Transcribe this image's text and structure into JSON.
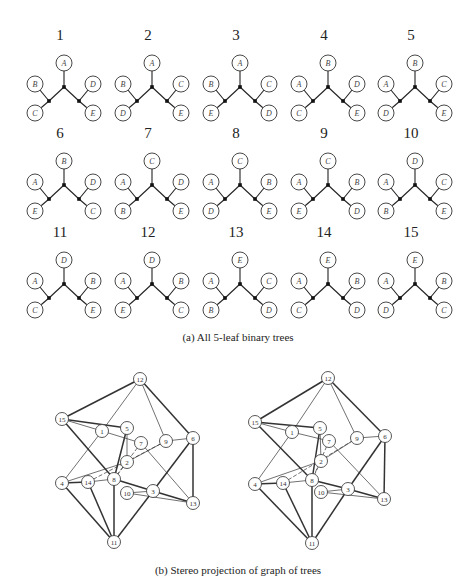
{
  "figure": {
    "part_a": {
      "caption": "(a) All 5-leaf binary trees",
      "trees": [
        {
          "id": "1",
          "top": "A",
          "left_upper": "B",
          "left_lower": "C",
          "right_upper": "D",
          "right_lower": "E"
        },
        {
          "id": "2",
          "top": "A",
          "left_upper": "B",
          "left_lower": "D",
          "right_upper": "C",
          "right_lower": "E"
        },
        {
          "id": "3",
          "top": "A",
          "left_upper": "B",
          "left_lower": "E",
          "right_upper": "C",
          "right_lower": "D"
        },
        {
          "id": "4",
          "top": "B",
          "left_upper": "A",
          "left_lower": "C",
          "right_upper": "D",
          "right_lower": "E"
        },
        {
          "id": "5",
          "top": "B",
          "left_upper": "A",
          "left_lower": "D",
          "right_upper": "C",
          "right_lower": "E"
        },
        {
          "id": "6",
          "top": "B",
          "left_upper": "A",
          "left_lower": "E",
          "right_upper": "D",
          "right_lower": "C"
        },
        {
          "id": "7",
          "top": "C",
          "left_upper": "A",
          "left_lower": "B",
          "right_upper": "D",
          "right_lower": "E"
        },
        {
          "id": "8",
          "top": "C",
          "left_upper": "A",
          "left_lower": "D",
          "right_upper": "B",
          "right_lower": "E"
        },
        {
          "id": "9",
          "top": "C",
          "left_upper": "A",
          "left_lower": "E",
          "right_upper": "B",
          "right_lower": "D"
        },
        {
          "id": "10",
          "top": "D",
          "left_upper": "A",
          "left_lower": "B",
          "right_upper": "C",
          "right_lower": "E"
        },
        {
          "id": "11",
          "top": "D",
          "left_upper": "A",
          "left_lower": "C",
          "right_upper": "B",
          "right_lower": "E"
        },
        {
          "id": "12",
          "top": "D",
          "left_upper": "A",
          "left_lower": "E",
          "right_upper": "B",
          "right_lower": "C"
        },
        {
          "id": "13",
          "top": "E",
          "left_upper": "A",
          "left_lower": "B",
          "right_upper": "C",
          "right_lower": "D"
        },
        {
          "id": "14",
          "top": "E",
          "left_upper": "A",
          "left_lower": "C",
          "right_upper": "B",
          "right_lower": "D"
        },
        {
          "id": "15",
          "top": "E",
          "left_upper": "A",
          "left_lower": "D",
          "right_upper": "B",
          "right_lower": "C"
        }
      ]
    },
    "part_b": {
      "caption": "(b) Stereo projection of graph of trees",
      "left_nodes": {
        "12": [
          140,
          379
        ],
        "15": [
          62,
          419
        ],
        "1": [
          102,
          431
        ],
        "5": [
          127,
          428
        ],
        "7": [
          141,
          443
        ],
        "9": [
          166,
          441
        ],
        "6": [
          193,
          438
        ],
        "2": [
          127,
          462
        ],
        "4": [
          62,
          483
        ],
        "14": [
          88,
          482
        ],
        "8": [
          114,
          479
        ],
        "10": [
          127,
          493
        ],
        "3": [
          153,
          491
        ],
        "13": [
          193,
          503
        ],
        "11": [
          114,
          542
        ]
      },
      "right_nodes": {
        "12": [
          328,
          378
        ],
        "15": [
          255,
          422
        ],
        "1": [
          292,
          432
        ],
        "5": [
          320,
          428
        ],
        "7": [
          329,
          441
        ],
        "9": [
          357,
          438
        ],
        "6": [
          385,
          436
        ],
        "2": [
          321,
          461
        ],
        "4": [
          255,
          484
        ],
        "14": [
          283,
          483
        ],
        "8": [
          312,
          480
        ],
        "10": [
          321,
          492
        ],
        "3": [
          348,
          489
        ],
        "13": [
          384,
          499
        ],
        "11": [
          312,
          543
        ]
      },
      "thick_edges": [
        [
          "12",
          "15"
        ],
        [
          "12",
          "6"
        ],
        [
          "15",
          "5"
        ],
        [
          "15",
          "8"
        ],
        [
          "5",
          "8"
        ],
        [
          "6",
          "13"
        ],
        [
          "6",
          "3"
        ],
        [
          "8",
          "3"
        ],
        [
          "4",
          "11"
        ],
        [
          "14",
          "11"
        ],
        [
          "8",
          "11"
        ],
        [
          "3",
          "11"
        ],
        [
          "4",
          "14"
        ],
        [
          "3",
          "13"
        ]
      ],
      "thin_edges": [
        [
          "12",
          "1"
        ],
        [
          "12",
          "9"
        ],
        [
          "15",
          "1"
        ],
        [
          "1",
          "7"
        ],
        [
          "1",
          "4"
        ],
        [
          "9",
          "6"
        ],
        [
          "9",
          "2"
        ],
        [
          "7",
          "13"
        ],
        [
          "4",
          "2"
        ],
        [
          "14",
          "8"
        ],
        [
          "10",
          "13"
        ],
        [
          "10",
          "3"
        ],
        [
          "5",
          "2"
        ]
      ],
      "dashed_edges": [
        [
          "14",
          "9"
        ],
        [
          "2",
          "8"
        ],
        [
          "7",
          "8"
        ]
      ]
    }
  }
}
